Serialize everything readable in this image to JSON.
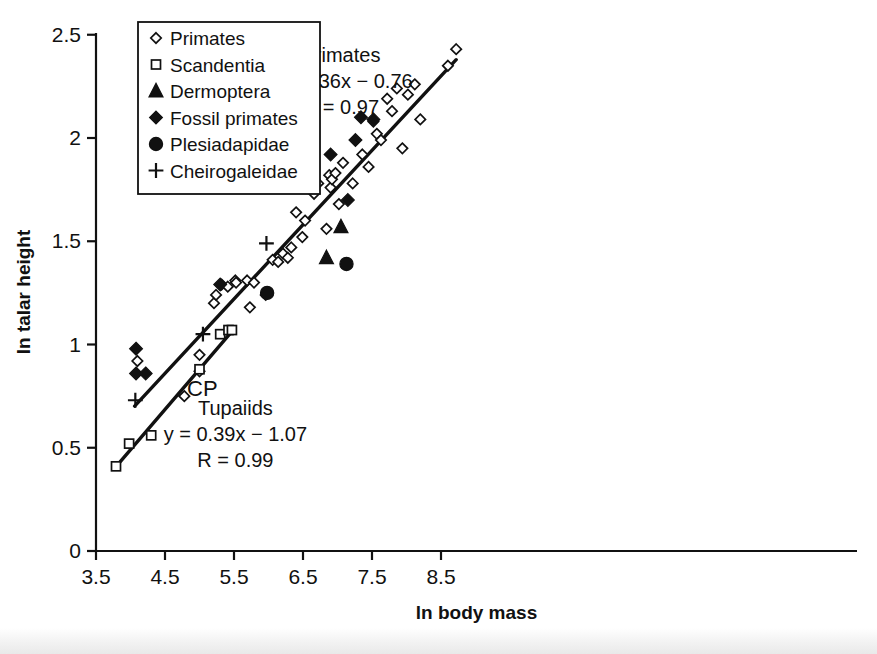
{
  "chart_data": {
    "type": "scatter",
    "title": "",
    "xlabel": "ln body mass",
    "ylabel": "ln talar height",
    "xlim": [
      3.5,
      8.9
    ],
    "ylim": [
      0,
      2.5
    ],
    "xticks": [
      3.5,
      4.5,
      5.5,
      6.5,
      7.5,
      8.5
    ],
    "xticklabels": [
      "3.5",
      "4.5",
      "5.5",
      "6.5",
      "7.5",
      "8.5"
    ],
    "yticks": [
      0,
      0.5,
      1,
      1.5,
      2,
      2.5
    ],
    "yticklabels": [
      "0",
      "0.5",
      "1",
      "1.5",
      "2",
      "2.5"
    ],
    "grid": false,
    "legend_position": "top-left",
    "legend": [
      {
        "label": "Primates",
        "marker": "open-diamond"
      },
      {
        "label": "Scandentia",
        "marker": "open-square"
      },
      {
        "label": "Dermoptera",
        "marker": "filled-triangle"
      },
      {
        "label": "Fossil primates",
        "marker": "filled-diamond"
      },
      {
        "label": "Plesiadapidae",
        "marker": "filled-circle"
      },
      {
        "label": "Cheirogaleidae",
        "marker": "plus"
      }
    ],
    "annotations": [
      {
        "name": "primates-fit",
        "lines": [
          "Primates",
          "y = 0.36x − 0.76",
          "R = 0.97"
        ],
        "x": 7.05,
        "y": 2.37
      },
      {
        "name": "tupaiids-fit",
        "lines": [
          "Tupaiids",
          "y = 0.39x − 1.07",
          "R = 0.99"
        ],
        "x": 5.52,
        "y": 0.66
      },
      {
        "name": "cp-label",
        "lines": [
          "CP"
        ],
        "x": 4.82,
        "y": 0.75
      }
    ],
    "trendlines": [
      {
        "name": "Primates",
        "slope": 0.36,
        "intercept": -0.76,
        "r": 0.97,
        "x_start": 4.06,
        "x_end": 8.72
      },
      {
        "name": "Tupaiids",
        "slope": 0.39,
        "intercept": -1.07,
        "r": 0.99,
        "x_start": 3.79,
        "x_end": 5.47
      }
    ],
    "series": [
      {
        "name": "Primates",
        "marker": "open-diamond",
        "points": [
          [
            4.1,
            0.92
          ],
          [
            4.78,
            0.75
          ],
          [
            5.0,
            0.95
          ],
          [
            5.0,
            0.87
          ],
          [
            5.21,
            1.2
          ],
          [
            5.24,
            1.24
          ],
          [
            5.32,
            1.29
          ],
          [
            5.41,
            1.28
          ],
          [
            5.52,
            1.31
          ],
          [
            5.53,
            1.3
          ],
          [
            5.69,
            1.31
          ],
          [
            5.73,
            1.18
          ],
          [
            5.79,
            1.3
          ],
          [
            5.96,
            1.24
          ],
          [
            6.06,
            1.41
          ],
          [
            6.14,
            1.4
          ],
          [
            6.21,
            1.44
          ],
          [
            6.28,
            1.42
          ],
          [
            6.33,
            1.47
          ],
          [
            6.4,
            1.64
          ],
          [
            6.49,
            1.52
          ],
          [
            6.53,
            1.6
          ],
          [
            6.6,
            1.76
          ],
          [
            6.66,
            1.73
          ],
          [
            6.72,
            1.78
          ],
          [
            6.84,
            1.56
          ],
          [
            6.88,
            1.82
          ],
          [
            6.9,
            1.76
          ],
          [
            6.92,
            1.8
          ],
          [
            6.97,
            1.83
          ],
          [
            7.02,
            1.68
          ],
          [
            7.08,
            1.88
          ],
          [
            7.22,
            1.78
          ],
          [
            7.36,
            1.92
          ],
          [
            7.45,
            1.86
          ],
          [
            7.52,
            2.08
          ],
          [
            7.57,
            2.02
          ],
          [
            7.63,
            1.99
          ],
          [
            7.72,
            2.19
          ],
          [
            7.79,
            2.13
          ],
          [
            7.86,
            2.24
          ],
          [
            7.94,
            1.95
          ],
          [
            8.02,
            2.21
          ],
          [
            8.12,
            2.26
          ],
          [
            8.2,
            2.09
          ],
          [
            8.6,
            2.35
          ],
          [
            8.72,
            2.43
          ]
        ]
      },
      {
        "name": "Scandentia",
        "marker": "open-square",
        "points": [
          [
            3.79,
            0.41
          ],
          [
            3.98,
            0.52
          ],
          [
            4.3,
            0.56
          ],
          [
            5.0,
            0.88
          ],
          [
            5.3,
            1.05
          ],
          [
            5.42,
            1.07
          ],
          [
            5.47,
            1.07
          ]
        ]
      },
      {
        "name": "Dermoptera",
        "marker": "filled-triangle",
        "points": [
          [
            6.84,
            1.42
          ],
          [
            7.05,
            1.57
          ]
        ]
      },
      {
        "name": "Fossil primates",
        "marker": "filled-diamond",
        "points": [
          [
            4.08,
            0.98
          ],
          [
            4.08,
            0.86
          ],
          [
            4.22,
            0.86
          ],
          [
            5.3,
            1.29
          ],
          [
            6.64,
            1.84
          ],
          [
            6.9,
            1.92
          ],
          [
            7.15,
            1.7
          ],
          [
            7.26,
            1.99
          ],
          [
            7.34,
            2.1
          ],
          [
            7.52,
            2.09
          ]
        ]
      },
      {
        "name": "Plesiadapidae",
        "marker": "filled-circle",
        "points": [
          [
            5.98,
            1.25
          ],
          [
            7.13,
            1.39
          ]
        ]
      },
      {
        "name": "Cheirogaleidae",
        "marker": "plus",
        "points": [
          [
            4.07,
            0.73
          ],
          [
            5.05,
            1.05
          ],
          [
            5.97,
            1.49
          ]
        ]
      }
    ]
  }
}
